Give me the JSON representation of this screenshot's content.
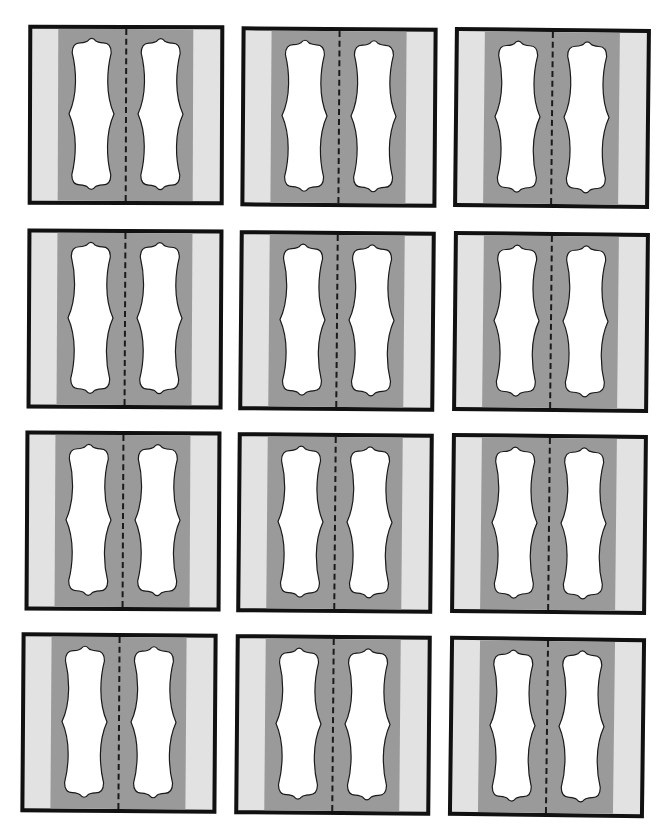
{
  "page": {
    "title_fragment": "",
    "background": "#ffffff"
  },
  "colors": {
    "border": "#111111",
    "outer_strip": "#e2e2e2",
    "band": "#9a9a9a",
    "label_fill": "#ffffff",
    "fold_line": "#1a1a1a"
  },
  "cards": [
    {
      "id": 1,
      "row": 1,
      "col": 1,
      "x": 28,
      "y": 25,
      "w": 196,
      "h": 180,
      "rot": 0.2
    },
    {
      "id": 2,
      "row": 1,
      "col": 2,
      "x": 241,
      "y": 27,
      "w": 196,
      "h": 180,
      "rot": 0.4
    },
    {
      "id": 3,
      "row": 1,
      "col": 3,
      "x": 454,
      "y": 28,
      "w": 196,
      "h": 180,
      "rot": 0.6
    },
    {
      "id": 4,
      "row": 2,
      "col": 1,
      "x": 27,
      "y": 229,
      "w": 196,
      "h": 180,
      "rot": 0.3
    },
    {
      "id": 5,
      "row": 2,
      "col": 2,
      "x": 239,
      "y": 231,
      "w": 196,
      "h": 180,
      "rot": 0.5
    },
    {
      "id": 6,
      "row": 2,
      "col": 3,
      "x": 453,
      "y": 232,
      "w": 196,
      "h": 180,
      "rot": 0.6
    },
    {
      "id": 7,
      "row": 3,
      "col": 1,
      "x": 25,
      "y": 431,
      "w": 196,
      "h": 180,
      "rot": 0.3
    },
    {
      "id": 8,
      "row": 3,
      "col": 2,
      "x": 237,
      "y": 433,
      "w": 196,
      "h": 180,
      "rot": 0.5
    },
    {
      "id": 9,
      "row": 3,
      "col": 3,
      "x": 451,
      "y": 434,
      "w": 196,
      "h": 180,
      "rot": 0.6
    },
    {
      "id": 10,
      "row": 4,
      "col": 1,
      "x": 21,
      "y": 633,
      "w": 196,
      "h": 180,
      "rot": 0.4
    },
    {
      "id": 11,
      "row": 4,
      "col": 2,
      "x": 235,
      "y": 635,
      "w": 196,
      "h": 180,
      "rot": 0.5
    },
    {
      "id": 12,
      "row": 4,
      "col": 3,
      "x": 449,
      "y": 637,
      "w": 196,
      "h": 180,
      "rot": 0.7
    }
  ]
}
